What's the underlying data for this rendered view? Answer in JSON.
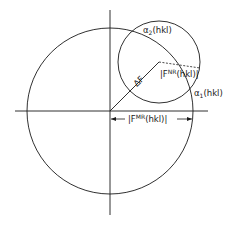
{
  "diagram": {
    "colors": {
      "stroke": "#1a1a1a",
      "background": "#ffffff"
    },
    "labels": {
      "alpha2_symbol": "α",
      "alpha2_sub": "2",
      "alpha2_rest": "(hkl)",
      "alpha1_symbol": "α",
      "alpha1_sub": "1",
      "alpha1_rest": "(hkl)",
      "fnr_prefix": "|F",
      "fnr_sup": "NR",
      "fnr_rest": "(hkl)|",
      "fmr_prefix": "|F",
      "fmr_sup": "MR",
      "fmr_rest": "(hkl)|",
      "delta_f": "ΔF"
    },
    "geometry": {
      "origin": [
        110,
        111
      ],
      "big_circle_radius": 83,
      "small_circle_center": [
        159,
        62
      ],
      "small_circle_radius": 41
    }
  }
}
